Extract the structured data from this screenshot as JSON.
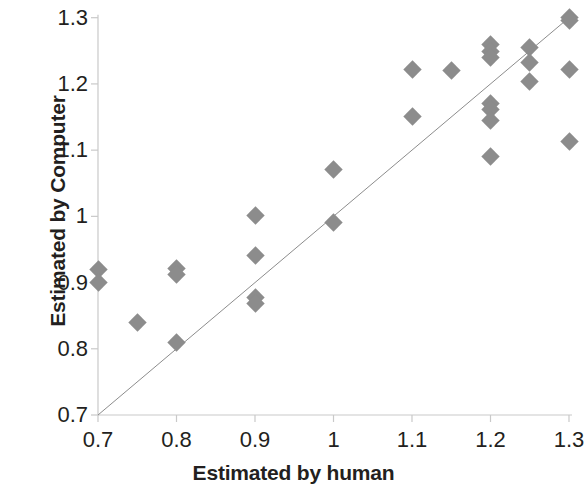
{
  "chart_data": {
    "type": "scatter",
    "title": "",
    "xlabel": "Estimated by human",
    "ylabel": "Estimated by Computer",
    "xlim": [
      0.7,
      1.3
    ],
    "ylim": [
      0.7,
      1.3
    ],
    "xticks": [
      "0.7",
      "0.8",
      "0.9",
      "1",
      "1.1",
      "1.2",
      "1.3"
    ],
    "yticks": [
      "0.7",
      "0.8",
      "0.9",
      "1",
      "1.1",
      "1.2",
      "1.3"
    ],
    "xtick_values": [
      0.7,
      0.8,
      0.9,
      1.0,
      1.1,
      1.2,
      1.3
    ],
    "ytick_values": [
      0.7,
      0.8,
      0.9,
      1.0,
      1.1,
      1.2,
      1.3
    ],
    "grid": false,
    "legend": "none",
    "marker": {
      "shape": "diamond",
      "color": "#8c8c8c",
      "size": 13
    },
    "reference_line": {
      "label": "y = x identity line",
      "color": "#8c8c8c",
      "width": 1,
      "from": [
        0.7,
        0.7
      ],
      "to": [
        1.3,
        1.3
      ]
    },
    "series": [
      {
        "name": "Estimates",
        "points": [
          [
            0.7,
            0.92
          ],
          [
            0.7,
            0.9
          ],
          [
            0.75,
            0.84
          ],
          [
            0.8,
            0.921
          ],
          [
            0.8,
            0.912
          ],
          [
            0.8,
            0.81
          ],
          [
            0.9,
            1.001
          ],
          [
            0.9,
            0.941
          ],
          [
            0.9,
            0.877
          ],
          [
            0.9,
            0.868
          ],
          [
            1.0,
            1.071
          ],
          [
            1.0,
            0.991
          ],
          [
            1.1,
            1.222
          ],
          [
            1.1,
            1.151
          ],
          [
            1.15,
            1.221
          ],
          [
            1.2,
            1.26
          ],
          [
            1.2,
            1.249
          ],
          [
            1.2,
            1.24
          ],
          [
            1.2,
            1.17
          ],
          [
            1.2,
            1.161
          ],
          [
            1.2,
            1.145
          ],
          [
            1.2,
            1.091
          ],
          [
            1.25,
            1.255
          ],
          [
            1.25,
            1.232
          ],
          [
            1.25,
            1.203
          ],
          [
            1.3,
            1.301
          ],
          [
            1.3,
            1.296
          ],
          [
            1.3,
            1.222
          ],
          [
            1.3,
            1.113
          ]
        ]
      }
    ]
  },
  "axes": {
    "axis_color": "#c9c9c9",
    "text_color": "#231f20"
  }
}
